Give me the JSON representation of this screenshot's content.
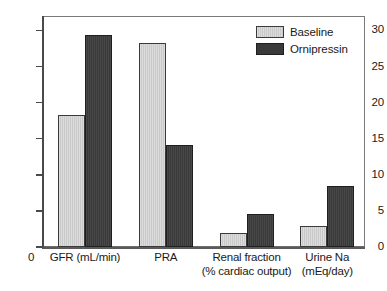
{
  "chart_data": {
    "type": "bar",
    "title": "",
    "xlabel": "",
    "ylabel": "",
    "ylim": [
      0,
      32
    ],
    "yticks": [
      0,
      5,
      10,
      15,
      20,
      25,
      30
    ],
    "ytick_labels": [
      "0",
      "5",
      "10",
      "15",
      "20",
      "25",
      "30"
    ],
    "grid": false,
    "legend_position": "top-right",
    "x_origin_label": "0",
    "categories": [
      "GFR (mL/min)",
      "PRA",
      "Renal fraction\n(% cardiac output)",
      "Urine Na\n(mEq/day)"
    ],
    "series": [
      {
        "name": "Baseline",
        "color": "#c9c9c9",
        "values": [
          18.3,
          28.3,
          2.0,
          2.9
        ]
      },
      {
        "name": "Ornipressin",
        "color": "#3a3a3a",
        "values": [
          29.3,
          14.1,
          4.6,
          8.4
        ]
      }
    ]
  },
  "legend": {
    "entries": [
      {
        "label": "Baseline",
        "swatch": "baseline-swatch"
      },
      {
        "label": "Ornipressin",
        "swatch": "ornipressin-swatch"
      }
    ]
  },
  "axes": {
    "y_labels": [
      "30",
      "25",
      "20",
      "15",
      "10",
      "5",
      "0"
    ],
    "x_zero": "0",
    "x_labels": [
      "GFR (mL/min)",
      "PRA",
      "Renal fraction\n(% cardiac output)",
      "Urine Na\n(mEq/day)"
    ]
  }
}
